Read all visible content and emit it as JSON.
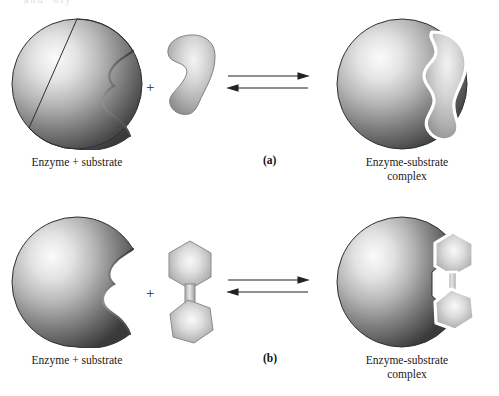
{
  "figure": {
    "top_ghost_text": "and ​ oly​",
    "background_color": "#ffffff",
    "width": 499,
    "height": 396
  },
  "palette": {
    "enzyme_light": "#f2f2f2",
    "enzyme_mid": "#9a9a9a",
    "enzyme_dark": "#4a4a4a",
    "enzyme_edge": "#2e2e2e",
    "substrate_light": "#ececec",
    "substrate_mid": "#b9b9b9",
    "substrate_dark": "#8d8d8d",
    "substrate_outline": "#ffffff",
    "text": "#1a1a1a",
    "arrow": "#222222"
  },
  "panels": [
    {
      "id": "a",
      "label": "(a)",
      "model": "lock-and-key",
      "left": {
        "enzyme_name": "enzyme-sphere-notched",
        "substrate_name": "substrate-crescent",
        "plus": "+",
        "caption": "Enzyme + substrate"
      },
      "arrows": {
        "forward": "forward-arrow",
        "reverse": "reverse-arrow"
      },
      "right": {
        "complex_name": "enzyme-substrate-complex-crescent",
        "caption": "Enzyme-substrate\ncomplex"
      }
    },
    {
      "id": "b",
      "label": "(b)",
      "model": "induced-fit",
      "left": {
        "enzyme_name": "enzyme-sphere-notched",
        "substrate_name": "substrate-dumbbell-hexagons",
        "plus": "+",
        "caption": "Enzyme + substrate"
      },
      "arrows": {
        "forward": "forward-arrow",
        "reverse": "reverse-arrow"
      },
      "right": {
        "complex_name": "enzyme-substrate-complex-dumbbell",
        "caption": "Enzyme-substrate\ncomplex"
      }
    }
  ]
}
